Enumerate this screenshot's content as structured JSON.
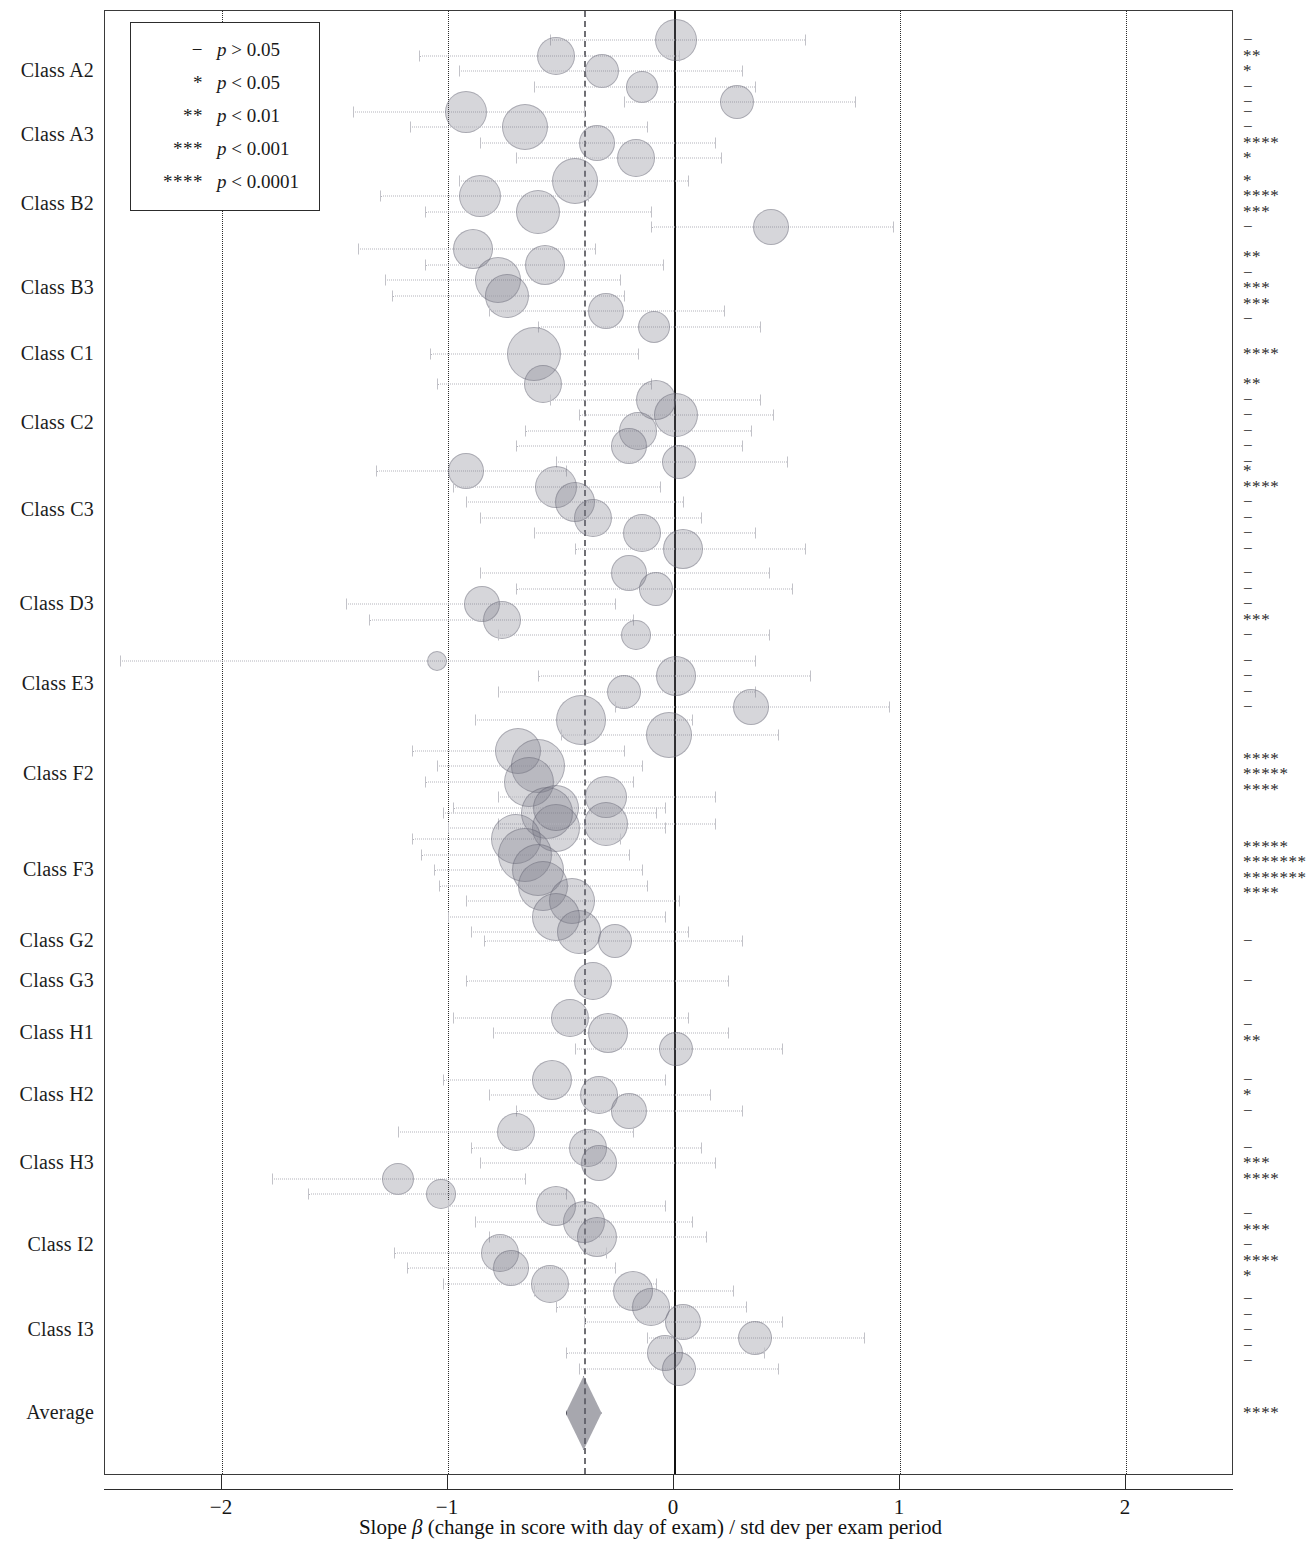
{
  "figure": {
    "type": "forest-plot",
    "x_axis": {
      "title_prefix": "Slope ",
      "title_symbol": "β",
      "title_suffix": " (change in score with day of exam) / std dev per exam period",
      "ticks": [
        -2,
        -1,
        0,
        1,
        2
      ],
      "tick_labels": [
        "−2",
        "−1",
        "0",
        "1",
        "2"
      ],
      "range": [
        -2.52,
        2.47
      ]
    },
    "reference_lines": [
      {
        "name": "null-line",
        "value": 0,
        "style": "solid"
      },
      {
        "name": "average-line",
        "value": -0.4,
        "style": "dashed"
      },
      {
        "name": "grid-minus-two",
        "value": -2,
        "style": "dotted"
      },
      {
        "name": "grid-minus-one",
        "value": -1,
        "style": "dotted"
      },
      {
        "name": "grid-plus-one",
        "value": 1,
        "style": "dotted"
      },
      {
        "name": "grid-plus-two",
        "value": 2,
        "style": "dotted"
      }
    ]
  },
  "legend": {
    "title": "",
    "rows": [
      {
        "symbol": "−",
        "text_p": "p",
        "text_rest": " > 0.05"
      },
      {
        "symbol": "*",
        "text_p": "p",
        "text_rest": " < 0.05"
      },
      {
        "symbol": "**",
        "text_p": "p",
        "text_rest": " < 0.01"
      },
      {
        "symbol": "***",
        "text_p": "p",
        "text_rest": " < 0.001"
      },
      {
        "symbol": "****",
        "text_p": "p",
        "text_rest": " < 0.0001"
      }
    ]
  },
  "chart_data": {
    "type": "scatter",
    "title": "",
    "xlabel": "Slope β (change in score with day of exam) / std dev per exam period",
    "ylabel": "",
    "xlim": [
      -2.52,
      2.47
    ],
    "grid": true,
    "legend_position": "top-left",
    "categories": [
      "Class A2",
      "Class A3",
      "Class B2",
      "Class B3",
      "Class C1",
      "Class C2",
      "Class C3",
      "Class D3",
      "Class E3",
      "Class F2",
      "Class F3",
      "Class G2",
      "Class G3",
      "Class H1",
      "Class H2",
      "Class H3",
      "Class I2",
      "Class I3",
      "Average"
    ],
    "groups": [
      {
        "label": "Class A2",
        "y": 70,
        "sig": [
          "−",
          "**",
          "*",
          "−",
          "−"
        ],
        "points": [
          {
            "x": 0.01,
            "lo": -0.55,
            "hi": 0.58,
            "size": 20
          },
          {
            "x": -0.52,
            "lo": -1.13,
            "hi": 0.02,
            "size": 18
          },
          {
            "x": -0.32,
            "lo": -0.95,
            "hi": 0.3,
            "size": 16
          },
          {
            "x": -0.14,
            "lo": -0.62,
            "hi": 0.36,
            "size": 15
          },
          {
            "x": 0.28,
            "lo": -0.22,
            "hi": 0.8,
            "size": 16
          }
        ]
      },
      {
        "label": "Class A3",
        "y": 134,
        "sig": [
          "−",
          "−",
          "****",
          "*"
        ],
        "points": [
          {
            "x": -0.92,
            "lo": -1.42,
            "hi": -0.4,
            "size": 20
          },
          {
            "x": -0.66,
            "lo": -1.17,
            "hi": -0.12,
            "size": 22
          },
          {
            "x": -0.34,
            "lo": -0.86,
            "hi": 0.18,
            "size": 17
          },
          {
            "x": -0.17,
            "lo": -0.7,
            "hi": 0.21,
            "size": 18
          }
        ]
      },
      {
        "label": "Class B2",
        "y": 203,
        "sig": [
          "*",
          "****",
          "***",
          "−"
        ],
        "points": [
          {
            "x": -0.44,
            "lo": -0.95,
            "hi": 0.06,
            "size": 22
          },
          {
            "x": -0.86,
            "lo": -1.3,
            "hi": -0.38,
            "size": 20
          },
          {
            "x": -0.6,
            "lo": -1.1,
            "hi": -0.1,
            "size": 21
          },
          {
            "x": 0.43,
            "lo": -0.1,
            "hi": 0.97,
            "size": 17
          }
        ]
      },
      {
        "label": "Class B3",
        "y": 287,
        "sig": [
          "**",
          "−",
          "***",
          "***",
          "−"
        ],
        "points": [
          {
            "x": -0.89,
            "lo": -1.4,
            "hi": -0.35,
            "size": 19
          },
          {
            "x": -0.57,
            "lo": -1.1,
            "hi": -0.05,
            "size": 19
          },
          {
            "x": -0.78,
            "lo": -1.28,
            "hi": -0.24,
            "size": 22
          },
          {
            "x": -0.74,
            "lo": -1.25,
            "hi": -0.22,
            "size": 21
          },
          {
            "x": -0.3,
            "lo": -0.82,
            "hi": 0.22,
            "size": 17
          },
          {
            "x": -0.09,
            "lo": -0.6,
            "hi": 0.38,
            "size": 15
          }
        ]
      },
      {
        "label": "Class C1",
        "y": 353,
        "sig": [
          "****"
        ],
        "points": [
          {
            "x": -0.62,
            "lo": -1.08,
            "hi": -0.16,
            "size": 26
          }
        ]
      },
      {
        "label": "Class C2",
        "y": 422,
        "sig": [
          "**",
          "−",
          "−",
          "−",
          "−",
          "−"
        ],
        "points": [
          {
            "x": -0.58,
            "lo": -1.05,
            "hi": -0.1,
            "size": 18
          },
          {
            "x": -0.08,
            "lo": -0.55,
            "hi": 0.38,
            "size": 19
          },
          {
            "x": 0.01,
            "lo": -0.42,
            "hi": 0.44,
            "size": 21
          },
          {
            "x": -0.16,
            "lo": -0.66,
            "hi": 0.34,
            "size": 18
          },
          {
            "x": -0.2,
            "lo": -0.7,
            "hi": 0.3,
            "size": 17
          },
          {
            "x": 0.02,
            "lo": -0.52,
            "hi": 0.5,
            "size": 16
          }
        ]
      },
      {
        "label": "Class C3",
        "y": 509,
        "sig": [
          "*",
          "****",
          "−",
          "−",
          "−",
          "−"
        ],
        "points": [
          {
            "x": -0.92,
            "lo": -1.32,
            "hi": -0.48,
            "size": 17
          },
          {
            "x": -0.52,
            "lo": -0.98,
            "hi": -0.06,
            "size": 20
          },
          {
            "x": -0.44,
            "lo": -0.92,
            "hi": 0.04,
            "size": 19
          },
          {
            "x": -0.36,
            "lo": -0.86,
            "hi": 0.12,
            "size": 18
          },
          {
            "x": -0.14,
            "lo": -0.62,
            "hi": 0.36,
            "size": 18
          },
          {
            "x": 0.04,
            "lo": -0.44,
            "hi": 0.58,
            "size": 19
          }
        ]
      },
      {
        "label": "Class D3",
        "y": 603,
        "sig": [
          "−",
          "−",
          "−",
          "***",
          "−"
        ],
        "points": [
          {
            "x": -0.2,
            "lo": -0.86,
            "hi": 0.42,
            "size": 17
          },
          {
            "x": -0.08,
            "lo": -0.7,
            "hi": 0.52,
            "size": 16
          },
          {
            "x": -0.85,
            "lo": -1.45,
            "hi": -0.26,
            "size": 17
          },
          {
            "x": -0.76,
            "lo": -1.35,
            "hi": -0.18,
            "size": 18
          },
          {
            "x": -0.17,
            "lo": -0.78,
            "hi": 0.42,
            "size": 14
          }
        ]
      },
      {
        "label": "Class E3",
        "y": 683,
        "sig": [
          "−",
          "−",
          "−",
          "−"
        ],
        "points": [
          {
            "x": -1.05,
            "lo": -2.45,
            "hi": 0.36,
            "size": 9
          },
          {
            "x": 0.01,
            "lo": -0.6,
            "hi": 0.6,
            "size": 19
          },
          {
            "x": -0.22,
            "lo": -0.78,
            "hi": 0.36,
            "size": 16
          },
          {
            "x": 0.34,
            "lo": -0.26,
            "hi": 0.95,
            "size": 17
          }
        ]
      },
      {
        "label": "Class F2",
        "y": 773,
        "sig": [
          "****",
          "*****",
          "****"
        ],
        "points": [
          {
            "x": -0.41,
            "lo": -0.88,
            "hi": 0.08,
            "size": 24
          },
          {
            "x": -0.02,
            "lo": -0.5,
            "hi": 0.46,
            "size": 22
          },
          {
            "x": -0.69,
            "lo": -1.16,
            "hi": -0.22,
            "size": 22
          },
          {
            "x": -0.6,
            "lo": -1.05,
            "hi": -0.14,
            "size": 26
          },
          {
            "x": -0.64,
            "lo": -1.1,
            "hi": -0.18,
            "size": 24
          },
          {
            "x": -0.3,
            "lo": -0.78,
            "hi": 0.18,
            "size": 20
          },
          {
            "x": -0.56,
            "lo": -1.02,
            "hi": -0.08,
            "size": 25
          },
          {
            "x": -0.52,
            "lo": -1.0,
            "hi": -0.04,
            "size": 23
          }
        ]
      },
      {
        "label": "Class F3",
        "y": 869,
        "sig": [
          "*****",
          "*******",
          "*******",
          "****"
        ],
        "points": [
          {
            "x": -0.52,
            "lo": -0.98,
            "hi": -0.04,
            "size": 22
          },
          {
            "x": -0.3,
            "lo": -0.78,
            "hi": 0.18,
            "size": 21
          },
          {
            "x": -0.7,
            "lo": -1.16,
            "hi": -0.24,
            "size": 24
          },
          {
            "x": -0.66,
            "lo": -1.12,
            "hi": -0.2,
            "size": 26
          },
          {
            "x": -0.6,
            "lo": -1.06,
            "hi": -0.14,
            "size": 25
          },
          {
            "x": -0.58,
            "lo": -1.04,
            "hi": -0.12,
            "size": 24
          },
          {
            "x": -0.45,
            "lo": -0.92,
            "hi": 0.02,
            "size": 22
          },
          {
            "x": -0.52,
            "lo": -1.0,
            "hi": -0.04,
            "size": 23
          },
          {
            "x": -0.42,
            "lo": -0.9,
            "hi": 0.06,
            "size": 21
          }
        ]
      },
      {
        "label": "Class G2",
        "y": 940,
        "sig": [
          "−"
        ],
        "points": [
          {
            "x": -0.26,
            "lo": -0.84,
            "hi": 0.3,
            "size": 16
          }
        ]
      },
      {
        "label": "Class G3",
        "y": 980,
        "sig": [
          "−"
        ],
        "points": [
          {
            "x": -0.36,
            "lo": -0.92,
            "hi": 0.24,
            "size": 18
          }
        ]
      },
      {
        "label": "Class H1",
        "y": 1032,
        "sig": [
          "−",
          "**"
        ],
        "points": [
          {
            "x": -0.46,
            "lo": -0.98,
            "hi": 0.06,
            "size": 18
          },
          {
            "x": -0.29,
            "lo": -0.8,
            "hi": 0.24,
            "size": 19
          },
          {
            "x": 0.01,
            "lo": -0.44,
            "hi": 0.48,
            "size": 16
          }
        ]
      },
      {
        "label": "Class H2",
        "y": 1094,
        "sig": [
          "−",
          "*",
          "−"
        ],
        "points": [
          {
            "x": -0.54,
            "lo": -1.02,
            "hi": -0.04,
            "size": 19
          },
          {
            "x": -0.33,
            "lo": -0.82,
            "hi": 0.16,
            "size": 18
          },
          {
            "x": -0.2,
            "lo": -0.7,
            "hi": 0.3,
            "size": 17
          }
        ]
      },
      {
        "label": "Class H3",
        "y": 1162,
        "sig": [
          "−",
          "***",
          "****"
        ],
        "points": [
          {
            "x": -0.7,
            "lo": -1.22,
            "hi": -0.18,
            "size": 18
          },
          {
            "x": -0.38,
            "lo": -0.9,
            "hi": 0.12,
            "size": 18
          },
          {
            "x": -0.33,
            "lo": -0.86,
            "hi": 0.18,
            "size": 17
          },
          {
            "x": -1.22,
            "lo": -1.78,
            "hi": -0.66,
            "size": 15
          },
          {
            "x": -1.03,
            "lo": -1.62,
            "hi": -0.48,
            "size": 14
          }
        ]
      },
      {
        "label": "Class I2",
        "y": 1244,
        "sig": [
          "−",
          "***",
          "−",
          "****",
          "*"
        ],
        "points": [
          {
            "x": -0.52,
            "lo": -1.0,
            "hi": -0.04,
            "size": 19
          },
          {
            "x": -0.4,
            "lo": -0.88,
            "hi": 0.08,
            "size": 20
          },
          {
            "x": -0.34,
            "lo": -0.82,
            "hi": 0.14,
            "size": 19
          },
          {
            "x": -0.77,
            "lo": -1.24,
            "hi": -0.3,
            "size": 18
          },
          {
            "x": -0.72,
            "lo": -1.18,
            "hi": -0.26,
            "size": 17
          },
          {
            "x": -0.55,
            "lo": -1.02,
            "hi": -0.08,
            "size": 18
          }
        ]
      },
      {
        "label": "Class I3",
        "y": 1329,
        "sig": [
          "−",
          "−",
          "−",
          "−",
          "−"
        ],
        "points": [
          {
            "x": -0.18,
            "lo": -0.62,
            "hi": 0.26,
            "size": 19
          },
          {
            "x": -0.1,
            "lo": -0.52,
            "hi": 0.32,
            "size": 18
          },
          {
            "x": 0.04,
            "lo": -0.4,
            "hi": 0.48,
            "size": 17
          },
          {
            "x": 0.36,
            "lo": -0.12,
            "hi": 0.84,
            "size": 16
          },
          {
            "x": -0.04,
            "lo": -0.48,
            "hi": 0.4,
            "size": 17
          },
          {
            "x": 0.02,
            "lo": -0.42,
            "hi": 0.46,
            "size": 16
          }
        ]
      },
      {
        "label": "Average",
        "y": 1412,
        "sig": [
          "****"
        ],
        "points": [],
        "summary": {
          "x": -0.4,
          "lo": -0.48,
          "hi": -0.32,
          "shape": "diamond"
        }
      }
    ]
  }
}
